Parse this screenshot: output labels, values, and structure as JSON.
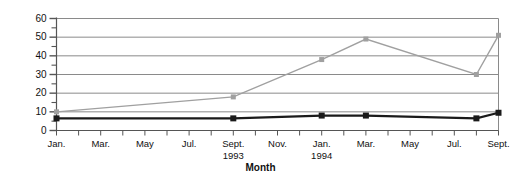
{
  "chart_data": {
    "type": "line",
    "title": "",
    "xlabel": "Month",
    "ylabel": "% \"drugs\" – % \"crime\"",
    "ylim": [
      0,
      60
    ],
    "ytick_step": 10,
    "yminor_step": 5,
    "grid": "horizontal",
    "legend": "none",
    "categories": [
      "Jan. 1993",
      "Feb. 1993",
      "Mar. 1993",
      "Apr. 1993",
      "May 1993",
      "Jun. 1993",
      "Jul. 1993",
      "Aug. 1993",
      "Sept. 1993",
      "Oct. 1993",
      "Nov. 1993",
      "Dec. 1993",
      "Jan. 1994",
      "Feb. 1994",
      "Mar. 1994",
      "Apr. 1994",
      "May 1994",
      "Jun. 1994",
      "Jul. 1994",
      "Aug. 1994",
      "Sept. 1994"
    ],
    "xticks": [
      {
        "index": 0,
        "label": "Jan.",
        "sub": ""
      },
      {
        "index": 2,
        "label": "Mar.",
        "sub": ""
      },
      {
        "index": 4,
        "label": "May",
        "sub": ""
      },
      {
        "index": 6,
        "label": "Jul.",
        "sub": ""
      },
      {
        "index": 8,
        "label": "Sept.",
        "sub": "1993"
      },
      {
        "index": 10,
        "label": "Nov.",
        "sub": ""
      },
      {
        "index": 12,
        "label": "Jan.",
        "sub": "1994"
      },
      {
        "index": 14,
        "label": "Mar.",
        "sub": ""
      },
      {
        "index": 16,
        "label": "May",
        "sub": ""
      },
      {
        "index": 18,
        "label": "Jul.",
        "sub": ""
      },
      {
        "index": 20,
        "label": "Sept.",
        "sub": ""
      }
    ],
    "yticks": [
      0,
      10,
      20,
      30,
      40,
      50,
      60
    ],
    "series": [
      {
        "name": "drugs",
        "color": "#a0a0a0",
        "marker": "square",
        "points": [
          {
            "index": 0,
            "value": 10
          },
          {
            "index": 8,
            "value": 18
          },
          {
            "index": 12,
            "value": 38
          },
          {
            "index": 14,
            "value": 49
          },
          {
            "index": 19,
            "value": 30
          },
          {
            "index": 20,
            "value": 51
          }
        ]
      },
      {
        "name": "crime",
        "color": "#1a1a1a",
        "marker": "square",
        "points": [
          {
            "index": 0,
            "value": 6.5
          },
          {
            "index": 8,
            "value": 6.5
          },
          {
            "index": 12,
            "value": 8
          },
          {
            "index": 14,
            "value": 8
          },
          {
            "index": 19,
            "value": 6.5
          },
          {
            "index": 20,
            "value": 9.5
          }
        ]
      }
    ]
  }
}
